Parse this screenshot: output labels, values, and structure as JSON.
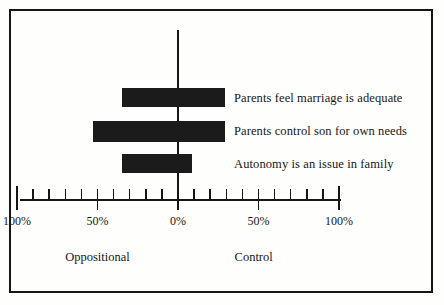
{
  "chart_data": {
    "type": "bar",
    "orientation": "horizontal",
    "layout": "diverging",
    "title": "",
    "xlabel": "",
    "ylabel": "",
    "xlim": [
      -100,
      100
    ],
    "grid": false,
    "legend": "none",
    "axis": {
      "zero_label": "0%",
      "tick_step": 10,
      "major_tick_step": 50,
      "tick_labels": [
        "100%",
        "50%",
        "0%",
        "50%",
        "100%"
      ],
      "tick_values": [
        -100,
        -50,
        0,
        50,
        100
      ],
      "minor_tick_values": [
        -90,
        -80,
        -70,
        -60,
        -40,
        -30,
        -20,
        -10,
        10,
        20,
        30,
        40,
        60,
        70,
        80,
        90
      ]
    },
    "direction_labels": {
      "left": "Oppositional",
      "right": "Control"
    },
    "categories": [
      "Parents feel marriage is adequate",
      "Parents control son for own needs",
      "Autonomy is an issue in family"
    ],
    "bars": [
      {
        "label": "Parents feel marriage is adequate",
        "negative": 35,
        "positive": 29,
        "start": -35,
        "end": 29
      },
      {
        "label": "Parents control son for own needs",
        "negative": 53,
        "positive": 29,
        "start": -53,
        "end": 29
      },
      {
        "label": "Autonomy is an issue in family",
        "negative": 35,
        "positive": 9,
        "start": -35,
        "end": 9
      }
    ],
    "colors": {
      "bar": "#1b1b1b",
      "axis": "#161616",
      "frame": "#161616",
      "background": "#fefefc",
      "text": "#171717"
    }
  }
}
